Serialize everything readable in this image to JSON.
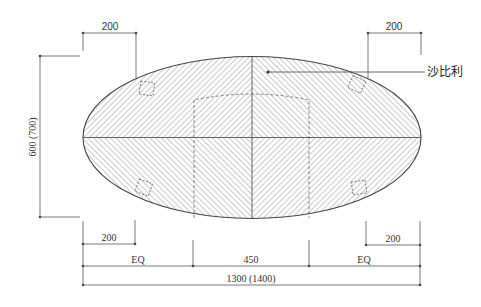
{
  "drawing": {
    "type": "plan-view",
    "shape": "ellipse",
    "material_label": "沙比利",
    "colors": {
      "line": "#444444",
      "hatch": "#8a8a8a",
      "dim": "#555555",
      "background": "#ffffff"
    }
  },
  "dimensions": {
    "top_left": "200",
    "top_right": "200",
    "height": "600 (700)",
    "bottom_left": "200",
    "bottom_right": "200",
    "segment_left": "EQ",
    "segment_middle": "450",
    "segment_right": "EQ",
    "overall_width": "1300 (1400)"
  }
}
